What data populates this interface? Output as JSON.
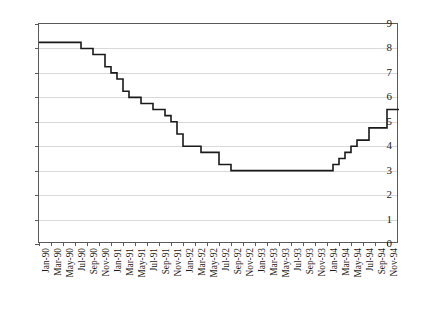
{
  "chart_data": {
    "type": "line",
    "line_style": "step",
    "title": "",
    "subtitle": "",
    "xlabel": "",
    "ylabel": "",
    "ylim": [
      0,
      9
    ],
    "ytick_values": [
      0,
      1,
      2,
      3,
      4,
      5,
      6,
      7,
      8,
      9
    ],
    "ytick_labels": [
      "0",
      "1",
      "2",
      "3",
      "4",
      "5",
      "6",
      "7",
      "8",
      "9"
    ],
    "grid": true,
    "grid_axis": "y",
    "legend": false,
    "legend_position": "none",
    "annotations": [],
    "line_color": "#1a1a1a",
    "grid_color": "#d9d9d9",
    "axis_color": "#5a5a5a",
    "background_color": "#ffffff",
    "xtick_labels": [
      "Jan-90",
      "Mar-90",
      "May-90",
      "Jul-90",
      "Sep-90",
      "Nov-90",
      "Jan-91",
      "Mar-91",
      "May-91",
      "Jul-91",
      "Sep-91",
      "Nov-91",
      "Jan-92",
      "Mar-92",
      "May-92",
      "Jul-92",
      "Sep-92",
      "Nov-92",
      "Jan-93",
      "Mar-93",
      "May-93",
      "Jul-93",
      "Sep-93",
      "Nov-93",
      "Jan-94",
      "Mar-94",
      "May-94",
      "Jul-94",
      "Sep-94",
      "Nov-94"
    ],
    "x": [
      "Jan-90",
      "Feb-90",
      "Mar-90",
      "Apr-90",
      "May-90",
      "Jun-90",
      "Jul-90",
      "Aug-90",
      "Sep-90",
      "Oct-90",
      "Nov-90",
      "Dec-90",
      "Jan-91",
      "Feb-91",
      "Mar-91",
      "Apr-91",
      "May-91",
      "Jun-91",
      "Jul-91",
      "Aug-91",
      "Sep-91",
      "Oct-91",
      "Nov-91",
      "Dec-91",
      "Jan-92",
      "Feb-92",
      "Mar-92",
      "Apr-92",
      "May-92",
      "Jun-92",
      "Jul-92",
      "Aug-92",
      "Sep-92",
      "Oct-92",
      "Nov-92",
      "Dec-92",
      "Jan-93",
      "Feb-93",
      "Mar-93",
      "Apr-93",
      "May-93",
      "Jun-93",
      "Jul-93",
      "Aug-93",
      "Sep-93",
      "Oct-93",
      "Nov-93",
      "Dec-93",
      "Jan-94",
      "Feb-94",
      "Mar-94",
      "Apr-94",
      "May-94",
      "Jun-94",
      "Jul-94",
      "Aug-94",
      "Sep-94",
      "Oct-94",
      "Nov-94",
      "Dec-94"
    ],
    "values": [
      8.25,
      8.25,
      8.25,
      8.25,
      8.25,
      8.25,
      8.25,
      8.0,
      8.0,
      7.75,
      7.75,
      7.25,
      7.0,
      6.75,
      6.25,
      6.0,
      6.0,
      5.75,
      5.75,
      5.5,
      5.5,
      5.25,
      5.0,
      4.5,
      4.0,
      4.0,
      4.0,
      3.75,
      3.75,
      3.75,
      3.25,
      3.25,
      3.0,
      3.0,
      3.0,
      3.0,
      3.0,
      3.0,
      3.0,
      3.0,
      3.0,
      3.0,
      3.0,
      3.0,
      3.0,
      3.0,
      3.0,
      3.0,
      3.0,
      3.25,
      3.5,
      3.75,
      4.0,
      4.25,
      4.25,
      4.75,
      4.75,
      4.75,
      5.5,
      5.5
    ]
  }
}
